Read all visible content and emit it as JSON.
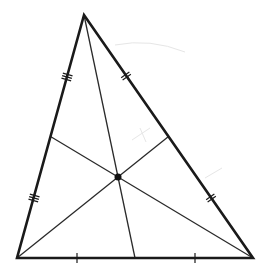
{
  "diagram": {
    "canvas": {
      "width": 268,
      "height": 279,
      "background": "#ffffff"
    },
    "colors": {
      "stroke": "#1a1a1a",
      "median": "#2a2a2a",
      "centroid": "#111111",
      "smudge": "#e6e6e6"
    },
    "vertices": {
      "A": {
        "x": 84,
        "y": 15
      },
      "B": {
        "x": 17,
        "y": 258
      },
      "C": {
        "x": 253,
        "y": 258
      }
    },
    "midpoints": {
      "AB": {
        "x": 50.5,
        "y": 136.5
      },
      "AC": {
        "x": 168.5,
        "y": 136.5
      },
      "BC": {
        "x": 135,
        "y": 258
      }
    },
    "centroid": {
      "x": 118,
      "y": 177,
      "radius": 3.5
    },
    "tick_marks": {
      "AB": {
        "count": 3,
        "positions": [
          {
            "x": 67,
            "y": 77
          },
          {
            "x": 34,
            "y": 198
          }
        ]
      },
      "AC": {
        "count": 2,
        "positions": [
          {
            "x": 126,
            "y": 76
          },
          {
            "x": 211,
            "y": 198
          }
        ]
      },
      "BC": {
        "count": 1,
        "positions": [
          {
            "x": 77,
            "y": 258
          },
          {
            "x": 195,
            "y": 258
          }
        ]
      }
    }
  }
}
